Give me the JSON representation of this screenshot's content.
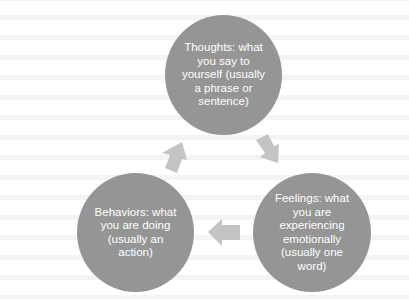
{
  "diagram": {
    "type": "cycle",
    "colors": {
      "node_fill": "#959595",
      "node_text": "#ffffff",
      "arrow_fill": "#c4c4c4",
      "background": "#ffffff"
    },
    "nodes": [
      {
        "id": "thoughts",
        "label": "Thoughts: what you say to yourself (usually a phrase or sentence)"
      },
      {
        "id": "feelings",
        "label": "Feelings: what you are experiencing emotionally (usually one word)"
      },
      {
        "id": "behaviors",
        "label": "Behaviors: what you are doing (usually an action)"
      }
    ],
    "edges": [
      {
        "from": "thoughts",
        "to": "feelings"
      },
      {
        "from": "feelings",
        "to": "behaviors"
      },
      {
        "from": "behaviors",
        "to": "thoughts"
      }
    ]
  }
}
